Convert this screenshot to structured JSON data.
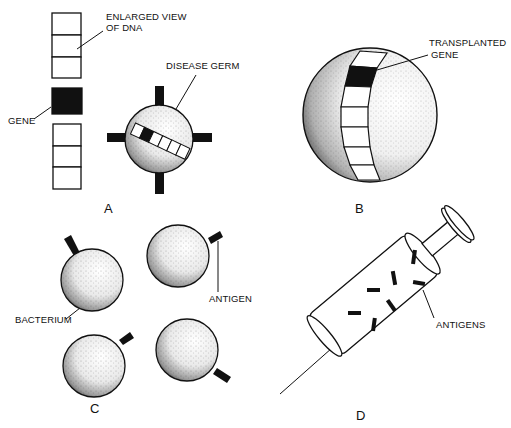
{
  "figure": {
    "panels": [
      {
        "id": "A",
        "letter": "A",
        "labels": {
          "dna": [
            "ENLARGED VIEW",
            "OF DNA"
          ],
          "gene": "GENE",
          "germ": "DISEASE GERM"
        }
      },
      {
        "id": "B",
        "letter": "B",
        "labels": {
          "transplanted": [
            "TRANSPLANTED",
            "GENE"
          ]
        }
      },
      {
        "id": "C",
        "letter": "C",
        "labels": {
          "bacterium": "BACTERIUM",
          "antigen": "ANTIGEN"
        }
      },
      {
        "id": "D",
        "letter": "D",
        "labels": {
          "antigens": "ANTIGENS"
        }
      }
    ]
  },
  "colors": {
    "ink": "#111111",
    "background": "#ffffff"
  }
}
